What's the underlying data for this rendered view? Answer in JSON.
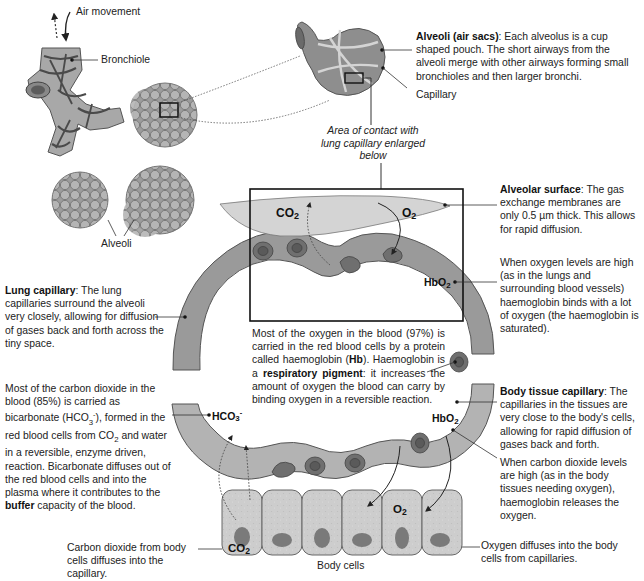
{
  "diagram": {
    "top_left": {
      "air_movement_label": "Air movement",
      "bronchiole_label": "Bronchiole",
      "alveoli_label": "Alveoli"
    },
    "alveolus_detail": {
      "heading": "Alveoli (air sacs)",
      "description": ": Each alveolus is a cup shaped pouch. The short airways from the alveoli merge with other airways forming small bronchioles and then larger bronchi.",
      "capillary_label": "Capillary",
      "area_of_contact": "Area of contact with lung capillary enlarged below"
    },
    "alveolar_surface": {
      "heading": "Alveolar surface",
      "description": ": The gas exchange membranes are only 0.5 µm thick. This allows for rapid diffusion.",
      "co2_label": "CO",
      "co2_sub": "2",
      "o2_label": "O",
      "o2_sub": "2"
    },
    "lung_capillary": {
      "heading": "Lung capillary",
      "description": ": The lung capillaries surround the alveoli very closely, allowing for diffusion of gases back and forth across the tiny space."
    },
    "oxygen_high": {
      "description": "When oxygen levels are high (as in the lungs and surrounding blood vessels) haemoglobin binds with a lot of oxygen  (the haemoglobin is saturated).",
      "hbo2_label": "HbO",
      "hbo2_sub": "2"
    },
    "haemoglobin": {
      "text_1": "Most of the oxygen in the blood (97%) is carried in the red blood cells by a protein called haemoglobin (",
      "hb_bold": "Hb",
      "text_2": "). Haemoglobin is a ",
      "pigment_bold": "respiratory pigment",
      "text_3": ": it increases the amount of oxygen the blood can carry by binding oxygen in a reversible reaction."
    },
    "bicarbonate": {
      "text_1": "Most of the carbon dioxide in the blood (85%) is carried as bicarbonate (HCO",
      "sub_3": "3",
      "sup_minus": "-",
      "text_2": "), formed in the red blood cells from CO",
      "sub_2": "2",
      "text_3": " and water in a reversible, enzyme driven, reaction. Bicarbonate diffuses out of the red blood cells and into the plasma where it contributes to the ",
      "buffer_bold": "buffer",
      "text_4": " capacity of the blood.",
      "hco3_label": "HCO",
      "hco3_sub": "3",
      "hco3_sup": "-"
    },
    "body_tissue_capillary": {
      "heading": "Body tissue capillary",
      "description": ": The capillaries in the tissues are very close to the body's cells, allowing for rapid diffusion of gases back and forth."
    },
    "co2_high": {
      "description": "When carbon dioxide levels are high (as in the body tissues needing oxygen), haemoglobin releases the oxygen.",
      "hbo2_label": "HbO",
      "hbo2_sub": "2"
    },
    "body_cells": {
      "co2_note": "Carbon dioxide from body cells diffuses into the capillary.",
      "co2_label": "CO",
      "co2_sub": "2",
      "o2_label": "O",
      "o2_sub": "2",
      "o2_note": "Oxygen diffuses into the body cells from capillaries.",
      "caption": "Body cells"
    },
    "colors": {
      "capillary_grey": "#9a9a9a",
      "alveolar_surface": "#d4d4d4",
      "body_cell_fill": "#cfcfcf",
      "nucleus": "#7a7a7a",
      "red_cell": "#6f6f6f",
      "line": "#333333"
    }
  }
}
